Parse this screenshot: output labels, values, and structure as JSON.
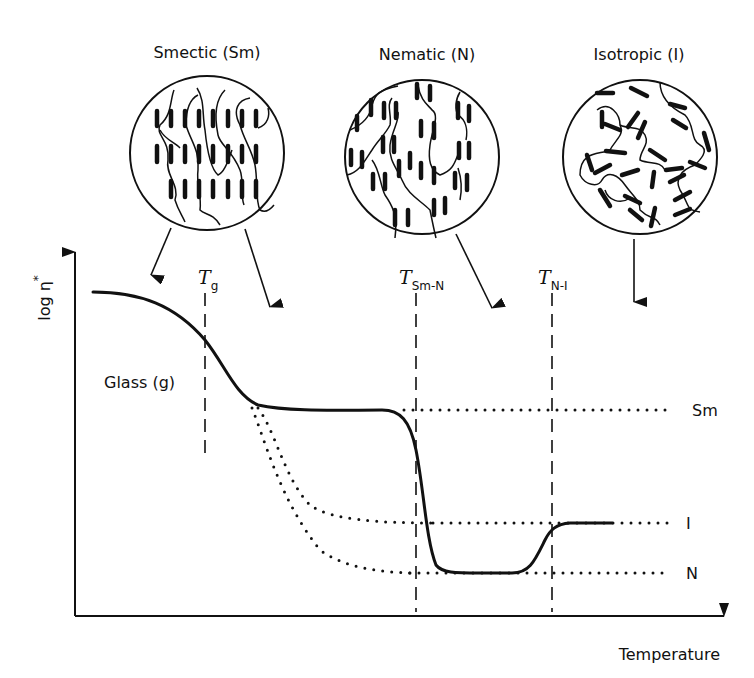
{
  "figure": {
    "phases": [
      {
        "key": "smectic",
        "label": "Smectic (Sm)",
        "cx": 207,
        "cy": 153,
        "r": 77
      },
      {
        "key": "nematic",
        "label": "Nematic (N)",
        "cx": 422,
        "cy": 157,
        "r": 77
      },
      {
        "key": "isotropic",
        "label": "Isotropic (I)",
        "cx": 640,
        "cy": 157,
        "r": 77
      }
    ],
    "axes": {
      "ylabel": "log η*",
      "ylabel_base": "log η",
      "ylabel_sup": "*",
      "xlabel": "Temperature"
    },
    "transitions": [
      {
        "key": "Tg",
        "T": "T",
        "sub": "g",
        "x": 205
      },
      {
        "key": "TSmN",
        "T": "T",
        "sub": "Sm-N",
        "x": 416
      },
      {
        "key": "TNI",
        "T": "T",
        "sub": "N-I",
        "x": 552
      }
    ],
    "region_label": "Glass (g)",
    "level_labels": {
      "sm": "Sm",
      "i": "I",
      "n": "N"
    },
    "colors": {
      "ink": "#111111",
      "background": "#ffffff"
    }
  }
}
